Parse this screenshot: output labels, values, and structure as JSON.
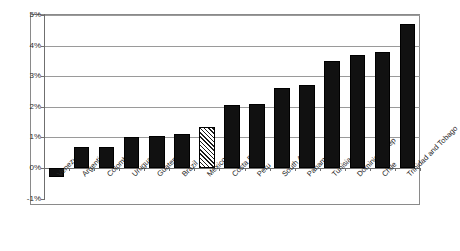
{
  "chart_data": {
    "type": "bar",
    "title": "",
    "subtitle": "",
    "xlabel": "",
    "ylabel": "",
    "ylim": [
      -1,
      5
    ],
    "ytick_labels": [
      "5%",
      "4%",
      "3%",
      "2%",
      "1%",
      "0%",
      "-1%"
    ],
    "ytick_values": [
      5,
      4,
      3,
      2,
      1,
      0,
      -1
    ],
    "grid": true,
    "legend": "none",
    "categories": [
      "Venezuela",
      "Argentina",
      "Colombia",
      "Uruguay",
      "Guatemala",
      "Brazil",
      "Mexico",
      "Costa Rica",
      "Peru",
      "South Africa",
      "Panama",
      "Tunisia",
      "Dominican Rep",
      "Chile",
      "Trinidad and Tobago"
    ],
    "values": [
      -0.3,
      0.7,
      0.7,
      1.0,
      1.05,
      1.1,
      1.35,
      2.05,
      2.1,
      2.6,
      2.7,
      3.5,
      3.7,
      3.8,
      4.7
    ],
    "highlight_category": "Mexico",
    "highlight_style": "hatched",
    "series": [
      {
        "name": "value",
        "values": [
          -0.3,
          0.7,
          0.7,
          1.0,
          1.05,
          1.1,
          1.35,
          2.05,
          2.1,
          2.6,
          2.7,
          3.5,
          3.7,
          3.8,
          4.7
        ]
      }
    ],
    "colors": {
      "bar": "#111111",
      "highlight_bar": "#ffffff",
      "gridline": "#9a9a9a",
      "axis": "#6f6f6f",
      "text": "#242424"
    }
  }
}
